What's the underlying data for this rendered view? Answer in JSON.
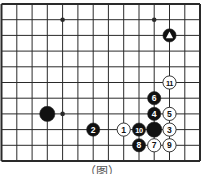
{
  "diagram": {
    "type": "go-board-fragment",
    "colors": {
      "background": "#ffffff",
      "line": "#2a2a2a",
      "black_stone": "#111111",
      "white_stone": "#ffffff",
      "stone_outline": "#222222"
    },
    "grid": {
      "columns": 14,
      "rows": 11,
      "x_positions": [
        1.5,
        16.8,
        32.1,
        47.3,
        62.6,
        77.9,
        93.2,
        108.4,
        123.7,
        139.0,
        154.2,
        169.5,
        184.8,
        200.0
      ],
      "y_positions": [
        4,
        19.7,
        35.4,
        51.1,
        66.8,
        82.5,
        98.2,
        113.9,
        129.6,
        145.3,
        161
      ],
      "border_edges": [
        "top",
        "right",
        "bottom",
        "left"
      ]
    },
    "star_points": [
      {
        "col": 4,
        "row": 1
      },
      {
        "col": 10,
        "row": 1
      },
      {
        "col": 4,
        "row": 7
      }
    ],
    "stones": [
      {
        "color": "black",
        "col": 11,
        "row": 2,
        "label": "",
        "marker": "triangle",
        "size": "normal"
      },
      {
        "color": "black",
        "col": 3,
        "row": 7,
        "label": "",
        "marker": "",
        "size": "large"
      },
      {
        "color": "white",
        "col": 8,
        "row": 8,
        "label": "1",
        "marker": "",
        "size": "normal"
      },
      {
        "color": "black",
        "col": 6,
        "row": 8,
        "label": "2",
        "marker": "",
        "size": "normal"
      },
      {
        "color": "white",
        "col": 11,
        "row": 8,
        "label": "3",
        "marker": "",
        "size": "normal"
      },
      {
        "color": "black",
        "col": 10,
        "row": 7,
        "label": "4",
        "marker": "",
        "size": "normal"
      },
      {
        "color": "white",
        "col": 11,
        "row": 7,
        "label": "5",
        "marker": "",
        "size": "normal"
      },
      {
        "color": "black",
        "col": 10,
        "row": 6,
        "label": "6",
        "marker": "",
        "size": "normal"
      },
      {
        "color": "white",
        "col": 10,
        "row": 9,
        "label": "7",
        "marker": "",
        "size": "normal"
      },
      {
        "color": "black",
        "col": 9,
        "row": 9,
        "label": "8",
        "marker": "",
        "size": "normal"
      },
      {
        "color": "white",
        "col": 11,
        "row": 9,
        "label": "9",
        "marker": "",
        "size": "normal"
      },
      {
        "color": "black",
        "col": 9,
        "row": 8,
        "label": "10",
        "marker": "",
        "size": "normal"
      },
      {
        "color": "white",
        "col": 11,
        "row": 5,
        "label": "11",
        "marker": "",
        "size": "normal"
      },
      {
        "color": "black",
        "col": 10,
        "row": 8,
        "label": "",
        "marker": "",
        "size": "large"
      }
    ],
    "caption": "（图）"
  }
}
